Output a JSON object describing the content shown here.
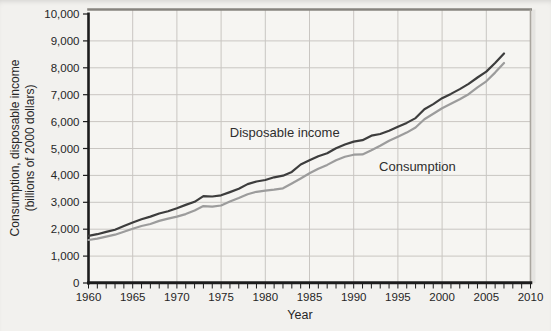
{
  "page": {
    "background": "#f2f1ee",
    "plot_background": "#f6f5f2"
  },
  "chart_data": {
    "type": "line",
    "title": "",
    "xlabel": "Year",
    "ylabel_lines": [
      "Consumption, disposable income",
      "(billions of 2000 dollars)"
    ],
    "xlim": [
      1960,
      2010
    ],
    "ylim": [
      0,
      10000
    ],
    "grid": true,
    "legend_position": "inline-annotations",
    "x_major_tick_step": 5,
    "x_minor_tick_step": 1,
    "y_tick_step": 1000,
    "x_tick_labels": [
      "1960",
      "1965",
      "1970",
      "1975",
      "1980",
      "1985",
      "1990",
      "1995",
      "2000",
      "2005",
      "2010"
    ],
    "y_tick_labels": [
      "0",
      "1,000",
      "2,000",
      "3,000",
      "4,000",
      "5,000",
      "6,000",
      "7,000",
      "8,000",
      "9,000",
      "10,000"
    ],
    "years": [
      1960,
      1961,
      1962,
      1963,
      1964,
      1965,
      1966,
      1967,
      1968,
      1969,
      1970,
      1971,
      1972,
      1973,
      1974,
      1975,
      1976,
      1977,
      1978,
      1979,
      1980,
      1981,
      1982,
      1983,
      1984,
      1985,
      1986,
      1987,
      1988,
      1989,
      1990,
      1991,
      1992,
      1993,
      1994,
      1995,
      1996,
      1997,
      1998,
      1999,
      2000,
      2001,
      2002,
      2003,
      2004,
      2005,
      2006,
      2007
    ],
    "series": [
      {
        "name": "Disposable income",
        "color": "#3d3d3d",
        "values": [
          1750,
          1815,
          1900,
          1980,
          2115,
          2250,
          2370,
          2470,
          2585,
          2670,
          2780,
          2905,
          3020,
          3230,
          3215,
          3260,
          3380,
          3500,
          3675,
          3775,
          3830,
          3930,
          3990,
          4130,
          4405,
          4560,
          4715,
          4820,
          5010,
          5150,
          5255,
          5310,
          5475,
          5540,
          5660,
          5810,
          5950,
          6130,
          6460,
          6650,
          6870,
          7030,
          7210,
          7400,
          7640,
          7860,
          8180,
          8530
        ],
        "label_anchor": {
          "x": 1982.2,
          "y": 5580
        }
      },
      {
        "name": "Consumption",
        "color": "#9c9c9c",
        "values": [
          1600,
          1650,
          1725,
          1795,
          1905,
          2015,
          2120,
          2195,
          2310,
          2395,
          2470,
          2560,
          2700,
          2860,
          2840,
          2880,
          3030,
          3160,
          3300,
          3390,
          3430,
          3470,
          3520,
          3700,
          3885,
          4080,
          4250,
          4390,
          4565,
          4690,
          4770,
          4780,
          4935,
          5100,
          5290,
          5440,
          5590,
          5780,
          6090,
          6290,
          6500,
          6660,
          6830,
          7020,
          7270,
          7500,
          7820,
          8180
        ],
        "label_anchor": {
          "x": 1997.2,
          "y": 4330
        }
      }
    ],
    "colors": {
      "axis": "#1c1c1c",
      "grid": "#c9c6c2",
      "frame_top": "#87847f",
      "frame_right": "#aaa69f",
      "text": "#262626"
    }
  }
}
